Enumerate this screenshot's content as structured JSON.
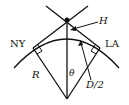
{
  "diagram": {
    "labels": {
      "ny": "NY",
      "la": "LA",
      "radius": "R",
      "angle": "θ",
      "height": "H",
      "half_distance": "D/2"
    },
    "colors": {
      "stroke": "#111111",
      "background": "#ffffff"
    }
  }
}
